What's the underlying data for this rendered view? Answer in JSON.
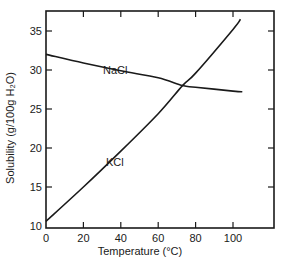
{
  "chart_data": {
    "type": "line",
    "title": "",
    "xlabel": "Temperature (°C)",
    "ylabel": "Solubility (g/100g H₂O)",
    "xlim": [
      0,
      120
    ],
    "ylim": [
      10,
      37.5
    ],
    "xticks": [
      0,
      20,
      40,
      60,
      80,
      100
    ],
    "yticks": [
      10,
      15,
      20,
      25,
      30,
      35
    ],
    "grid": false,
    "legend": "inline labels",
    "series": [
      {
        "name": "NaCl",
        "x": [
          0,
          20,
          40,
          60,
          73,
          80,
          100,
          105
        ],
        "values": [
          32.0,
          30.9,
          29.9,
          29.0,
          28.0,
          27.8,
          27.3,
          27.2
        ]
      },
      {
        "name": "KCl",
        "x": [
          0,
          20,
          40,
          60,
          73,
          80,
          100,
          104
        ],
        "values": [
          10.6,
          15.0,
          19.6,
          24.4,
          28.0,
          29.6,
          35.2,
          36.5
        ]
      }
    ],
    "annotations": [
      {
        "text": "NaCl",
        "x": 42,
        "y": 30.3
      },
      {
        "text": "KCl",
        "x": 41,
        "y": 18.4
      }
    ]
  },
  "labels": {
    "x_axis_title": "Temperature (°C)",
    "y_axis_title": "Solubility (g/100g H₂O)",
    "nacl": "NaCl",
    "kcl": "KCl"
  },
  "colors": {
    "line": "#1a1a1a",
    "background": "#ffffff"
  }
}
